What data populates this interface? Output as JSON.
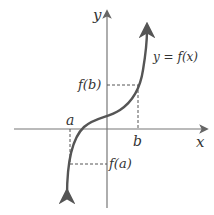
{
  "diagram": {
    "axis_labels": {
      "x": "x",
      "y": "y"
    },
    "curve_label": "y = f(x)",
    "points": {
      "a": "a",
      "b": "b",
      "fa": "f(a)",
      "fb": "f(b)"
    },
    "colors": {
      "curve": "#555555",
      "axis": "#666666",
      "text": "#333333"
    }
  }
}
